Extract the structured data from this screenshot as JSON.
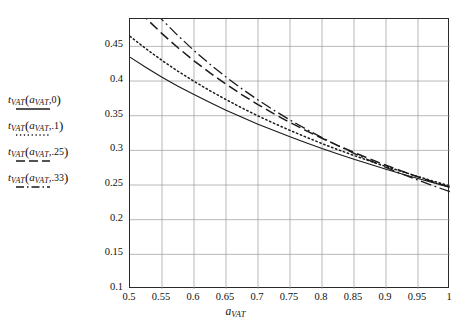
{
  "chart_data": {
    "type": "line",
    "title": "",
    "xlabel": "a_VAT",
    "ylabel": "",
    "xlim": [
      0.5,
      1.0
    ],
    "ylim": [
      0.1,
      0.4895
    ],
    "grid": true,
    "legend_position": "left-outside",
    "xticks": [
      "0.5",
      "0.55",
      "0.6",
      "0.65",
      "0.7",
      "0.75",
      "0.8",
      "0.85",
      "0.9",
      "0.95",
      "1"
    ],
    "xtick_values": [
      0.5,
      0.55,
      0.6,
      0.65,
      0.7,
      0.75,
      0.8,
      0.85,
      0.9,
      0.95,
      1.0
    ],
    "yticks": [
      "0.1",
      "0.15",
      "0.2",
      "0.25",
      "0.3",
      "0.35",
      "0.4",
      "0.45"
    ],
    "ytick_values": [
      0.1,
      0.15,
      0.2,
      0.25,
      0.3,
      0.35,
      0.4,
      0.45
    ],
    "x": [
      0.5,
      0.525,
      0.55,
      0.575,
      0.6,
      0.625,
      0.65,
      0.675,
      0.7,
      0.725,
      0.75,
      0.775,
      0.8,
      0.825,
      0.85,
      0.875,
      0.9,
      0.925,
      0.95,
      0.975,
      1.0
    ],
    "series": [
      {
        "name": "t_VAT(a_VAT,0)",
        "style": "solid",
        "color": "#1a1a1a",
        "values": [
          0.4345,
          0.4195,
          0.4055,
          0.3925,
          0.3805,
          0.369,
          0.358,
          0.3477,
          0.3378,
          0.3285,
          0.3196,
          0.311,
          0.3027,
          0.2948,
          0.2872,
          0.2799,
          0.2728,
          0.266,
          0.2594,
          0.2531,
          0.247
        ]
      },
      {
        "name": "t_VAT(a_VAT,.1)",
        "style": "dotted",
        "color": "#1a1a1a",
        "values": [
          0.4645,
          0.4465,
          0.4297,
          0.4141,
          0.3996,
          0.386,
          0.3732,
          0.3611,
          0.3497,
          0.339,
          0.3288,
          0.3191,
          0.3098,
          0.301,
          0.2926,
          0.2845,
          0.2768,
          0.2694,
          0.2622,
          0.2553,
          0.2487
        ]
      },
      {
        "name": "t_VAT(a_VAT,.25)",
        "style": "dashed",
        "color": "#1a1a1a",
        "values": [
          0.5145,
          0.4905,
          0.4684,
          0.448,
          0.4292,
          0.4117,
          0.3954,
          0.3802,
          0.366,
          0.3527,
          0.3402,
          0.3285,
          0.3174,
          0.3069,
          0.297,
          0.2875,
          0.2785,
          0.27,
          0.2618,
          0.254,
          0.2466
        ]
      },
      {
        "name": "t_VAT(a_VAT,.33)",
        "style": "dashdot",
        "color": "#1a1a1a",
        "values": [
          0.5412,
          0.5138,
          0.4886,
          0.4654,
          0.444,
          0.4242,
          0.4058,
          0.3887,
          0.3727,
          0.3578,
          0.3438,
          0.3307,
          0.3184,
          0.3067,
          0.2957,
          0.2853,
          0.2754,
          0.266,
          0.2571,
          0.2485,
          0.2404
        ]
      }
    ]
  },
  "legend": {
    "entries": [
      {
        "t": "t",
        "tsub": "VAT",
        "open": "(",
        "asym": "a",
        "asub": "VAT",
        "comma": ",",
        "param": "0",
        "close": ")",
        "style": "solid"
      },
      {
        "t": "t",
        "tsub": "VAT",
        "open": "(",
        "asym": "a",
        "asub": "VAT",
        "comma": ",",
        "param": ".1",
        "close": ")",
        "style": "dotted"
      },
      {
        "t": "t",
        "tsub": "VAT",
        "open": "(",
        "asym": "a",
        "asub": "VAT",
        "comma": ",",
        "param": ".25",
        "close": ")",
        "style": "dashed"
      },
      {
        "t": "t",
        "tsub": "VAT",
        "open": "(",
        "asym": "a",
        "asub": "VAT",
        "comma": ",",
        "param": ".33",
        "close": ")",
        "style": "dashdot"
      }
    ]
  },
  "axis_title": {
    "symbol": "a",
    "subscript": "VAT"
  },
  "colors": {
    "axis": "#2b2b2b",
    "grid": "#9a9a9a",
    "curve": "#1a1a1a",
    "background": "#ffffff"
  }
}
